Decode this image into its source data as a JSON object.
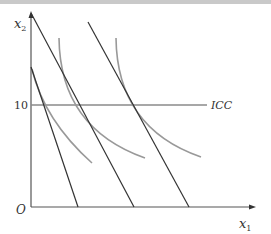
{
  "diagram": {
    "type": "economics-indifference-curve-diagram",
    "axes": {
      "origin_label": "O",
      "x_label": "x",
      "x_subscript": "1",
      "y_label": "x",
      "y_subscript": "2",
      "y_tick_label": "10"
    },
    "icc_label": "ICC",
    "budget_lines": [
      {
        "name": "budget-line-low",
        "from": [
          31,
          67
        ],
        "to": [
          78,
          207
        ]
      },
      {
        "name": "budget-line-mid",
        "from": [
          31,
          13
        ],
        "to": [
          134,
          207
        ]
      },
      {
        "name": "budget-line-high",
        "from": [
          88,
          22
        ],
        "to": [
          189,
          207
        ]
      }
    ],
    "indifference_curves": [
      {
        "name": "indifference-curve-low"
      },
      {
        "name": "indifference-curve-mid"
      },
      {
        "name": "indifference-curve-high"
      }
    ],
    "colors": {
      "axis": "#555555",
      "budget_line": "#333333",
      "indifference_curve": "#999999",
      "icc_line": "#8a8a8a",
      "top_band": "#c9c9c9"
    }
  }
}
